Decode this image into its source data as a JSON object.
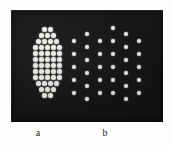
{
  "figure": {
    "panel_background": "#151515",
    "dot_color": "#f7f7f2",
    "page_background": "#fefefe",
    "labels": [
      {
        "text": "a",
        "name": "panel-label-a"
      },
      {
        "text": "b",
        "name": "panel-label-b"
      }
    ]
  },
  "chart_data": {
    "type": "scatter",
    "title": "",
    "subtitle": "",
    "xlabel": "",
    "ylabel": "",
    "grid": false,
    "legend_position": "none",
    "annotations": [
      "a",
      "b"
    ],
    "axis_ranges": {
      "xlim": [
        0,
        152
      ],
      "ylim": [
        0,
        112
      ]
    },
    "panels": [
      {
        "label": "a",
        "name": "dense-hexagonal-cluster",
        "packing": "hexagonal-close-packed",
        "pitch_px": 6.2,
        "dot_diameter_px": 5,
        "dot_count": 44,
        "rows": [
          {
            "row": 1,
            "y": 19,
            "count": 2,
            "x": [
              33,
              39
            ]
          },
          {
            "row": 2,
            "y": 25,
            "count": 3,
            "x": [
              30,
              36,
              42
            ]
          },
          {
            "row": 3,
            "y": 31,
            "count": 4,
            "x": [
              27,
              33,
              39,
              45
            ]
          },
          {
            "row": 4,
            "y": 37,
            "count": 5,
            "x": [
              24,
              30,
              36,
              42,
              48
            ]
          },
          {
            "row": 5,
            "y": 43,
            "count": 5,
            "x": [
              24,
              30,
              36,
              42,
              48
            ]
          },
          {
            "row": 6,
            "y": 49,
            "count": 5,
            "x": [
              24,
              30,
              36,
              42,
              48
            ]
          },
          {
            "row": 7,
            "y": 55,
            "count": 5,
            "x": [
              24,
              30,
              36,
              42,
              48
            ]
          },
          {
            "row": 8,
            "y": 61,
            "count": 5,
            "x": [
              24,
              30,
              36,
              42,
              48
            ]
          },
          {
            "row": 9,
            "y": 67,
            "count": 5,
            "x": [
              24,
              30,
              36,
              42,
              48
            ]
          },
          {
            "row": 10,
            "y": 73,
            "count": 4,
            "x": [
              27,
              33,
              39,
              45
            ]
          },
          {
            "row": 11,
            "y": 79,
            "count": 3,
            "x": [
              30,
              36,
              42
            ]
          },
          {
            "row": 12,
            "y": 85,
            "count": 2,
            "x": [
              33,
              39
            ]
          }
        ]
      },
      {
        "label": "b",
        "name": "sparse-staggered-lattice",
        "packing": "staggered-square",
        "pitch_px": 12.5,
        "dot_diameter_px": 4.6,
        "dot_count": 33,
        "columns": [
          {
            "col": 1,
            "x": 63,
            "count": 5,
            "y": [
              31,
              44,
              57,
              70,
              83
            ]
          },
          {
            "col": 2,
            "x": 76,
            "count": 6,
            "y": [
              24,
              37,
              50,
              63,
              76,
              89
            ]
          },
          {
            "col": 3,
            "x": 89,
            "count": 5,
            "y": [
              31,
              44,
              57,
              70,
              83
            ]
          },
          {
            "col": 4,
            "x": 102,
            "count": 6,
            "y": [
              18,
              31,
              44,
              57,
              70,
              83
            ]
          },
          {
            "col": 5,
            "x": 115,
            "count": 6,
            "y": [
              24,
              37,
              50,
              63,
              76,
              89
            ]
          },
          {
            "col": 6,
            "x": 128,
            "count": 5,
            "y": [
              31,
              44,
              57,
              70,
              83
            ]
          }
        ]
      }
    ]
  }
}
